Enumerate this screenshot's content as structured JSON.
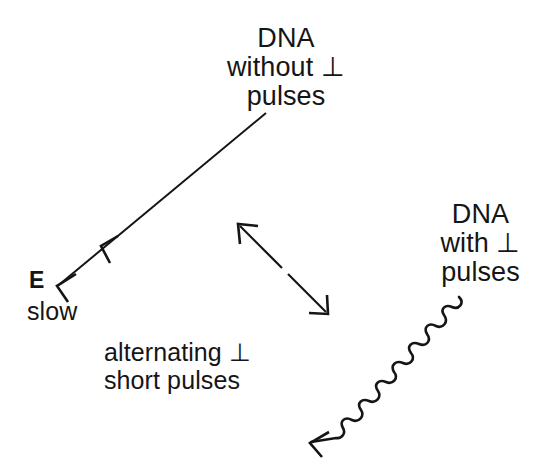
{
  "figure": {
    "background_color": "#ffffff",
    "ink_color": "#151515",
    "labels": {
      "dna_without_pulses": "DNA\nwithout ⊥\npulses",
      "dna_with_pulses": "DNA\nwith ⊥\npulses",
      "field_symbol": "E",
      "field_speed": "slow",
      "alternating_pulses": "alternating ⊥\nshort pulses"
    },
    "symbols": {
      "perpendicular": "⊥"
    },
    "arrows": [
      {
        "name": "long-diagonal-arrow",
        "style": "straight",
        "from": [
          266,
          113
        ],
        "to": [
          56,
          287
        ],
        "arrowheads": [
          "mid",
          "end"
        ],
        "direction": "down-left"
      },
      {
        "name": "bidirectional-arrow",
        "style": "straight-double-headed",
        "from": [
          238,
          224
        ],
        "to": [
          328,
          314
        ],
        "arrowheads": [
          "start",
          "end"
        ],
        "direction": "both"
      },
      {
        "name": "wavy-arrow",
        "style": "sinusoidal",
        "from": [
          459,
          298
        ],
        "to": [
          309,
          443
        ],
        "arrowheads": [
          "end"
        ],
        "direction": "down-left"
      }
    ]
  }
}
